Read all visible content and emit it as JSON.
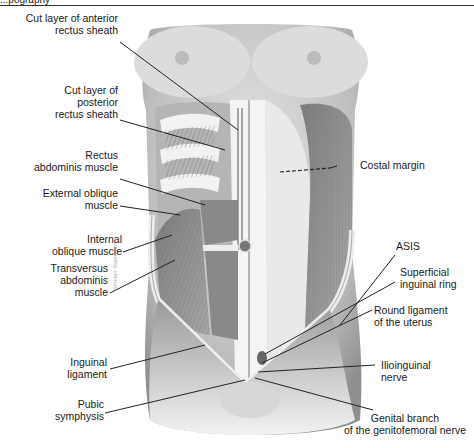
{
  "header": {
    "partial_text": "...pography",
    "rule_color": "#333333"
  },
  "figure": {
    "labels_left": [
      {
        "id": "cut-anterior-rectus-sheath",
        "line1": "Cut layer of anterior",
        "line2": "rectus sheath"
      },
      {
        "id": "cut-posterior-rectus-sheath",
        "line1": "Cut layer of",
        "line2": "posterior",
        "line3": "rectus sheath"
      },
      {
        "id": "rectus-abdominis",
        "line1": "Rectus",
        "line2": "abdominis muscle"
      },
      {
        "id": "external-oblique",
        "line1": "External oblique",
        "line2": "muscle"
      },
      {
        "id": "internal-oblique",
        "line1": "Internal",
        "line2": "oblique muscle"
      },
      {
        "id": "transversus-abdominis",
        "line1": "Transversus",
        "line2": "abdominis",
        "line3": "muscle"
      },
      {
        "id": "inguinal-ligament",
        "line1": "Inguinal",
        "line2": "ligament"
      },
      {
        "id": "pubic-symphysis",
        "line1": "Pubic",
        "line2": "symphysis"
      }
    ],
    "labels_right": [
      {
        "id": "costal-margin",
        "line1": "Costal margin"
      },
      {
        "id": "asis",
        "line1": "ASIS"
      },
      {
        "id": "superficial-inguinal-ring",
        "line1": "Superficial",
        "line2": "inguinal ring"
      },
      {
        "id": "round-ligament",
        "line1": "Round ligament",
        "line2": "of the uterus"
      },
      {
        "id": "ilioinguinal-nerve",
        "line1": "Ilioinguinal",
        "line2": "nerve"
      },
      {
        "id": "genital-branch",
        "line1": "Genital branch",
        "line2": "of the genitofemoral nerve"
      }
    ],
    "watermark": "Sinclair Stammers",
    "colors": {
      "skin": "#d9d9d9",
      "skin_shadow": "#9a9a9a",
      "muscle": "#8a8a8a",
      "sheath": "#ededed",
      "leader": "#222222"
    }
  }
}
